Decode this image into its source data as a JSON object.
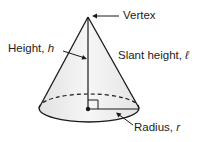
{
  "diagram": {
    "labels": {
      "vertex": "Vertex",
      "height": "Height, ",
      "height_var": "h",
      "slant": "Slant height, ",
      "slant_var": "ℓ",
      "radius": "Radius, ",
      "radius_var": "r"
    },
    "colors": {
      "line": "#1a1a1a",
      "fill": "#ececec",
      "text": "#222222"
    }
  }
}
